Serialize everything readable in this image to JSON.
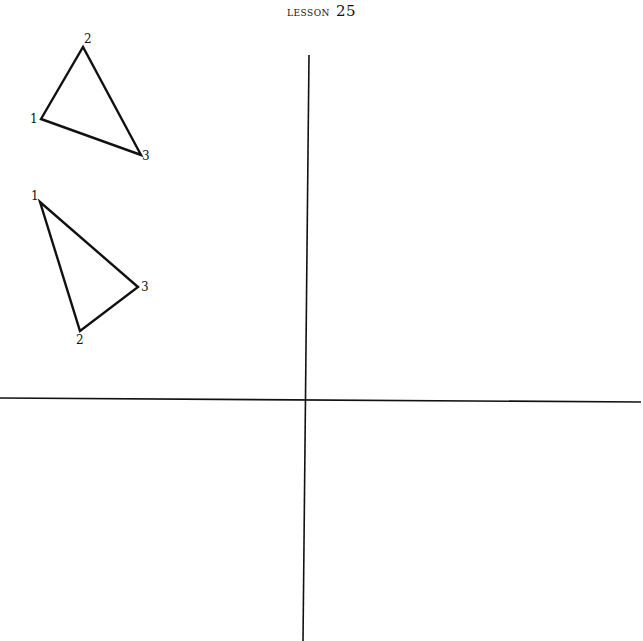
{
  "header": {
    "word": "LESSON",
    "number": "25"
  },
  "axes": {
    "vertical": {
      "x1": 309,
      "y1": 55,
      "x2": 303,
      "y2": 641
    },
    "horizontal": {
      "x1": 0,
      "y1": 398,
      "x2": 641,
      "y2": 402
    },
    "color": "#111111"
  },
  "triangles": [
    {
      "name": "triangle-a",
      "vertices": [
        {
          "label": "1",
          "x": 41,
          "y": 119,
          "lx": 30,
          "ly": 123
        },
        {
          "label": "2",
          "x": 83,
          "y": 47,
          "lx": 84,
          "ly": 43
        },
        {
          "label": "3",
          "x": 141,
          "y": 155,
          "lx": 142,
          "ly": 160
        }
      ]
    },
    {
      "name": "triangle-b",
      "vertices": [
        {
          "label": "1",
          "x": 40,
          "y": 202,
          "lx": 31,
          "ly": 200
        },
        {
          "label": "2",
          "x": 80,
          "y": 331,
          "lx": 76,
          "ly": 344
        },
        {
          "label": "3",
          "x": 138,
          "y": 287,
          "lx": 141,
          "ly": 291
        }
      ]
    }
  ]
}
